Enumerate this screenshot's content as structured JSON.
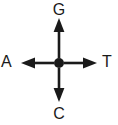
{
  "figure": {
    "type": "cross-arrow-diagram",
    "background_color": "#ffffff",
    "stroke_color": "#1a1a1a",
    "center": {
      "name": "center-node",
      "shape": "filled-circle",
      "x": 59,
      "y": 63,
      "radius": 5
    },
    "axes": [
      {
        "id": "top",
        "direction": "up",
        "label": "G",
        "arrow_tip": {
          "x": 59,
          "y": 18
        },
        "icon": "arrow-up-icon"
      },
      {
        "id": "right",
        "direction": "right",
        "label": "T",
        "arrow_tip": {
          "x": 97,
          "y": 63
        },
        "icon": "arrow-right-icon"
      },
      {
        "id": "bottom",
        "direction": "down",
        "label": "C",
        "arrow_tip": {
          "x": 59,
          "y": 102
        },
        "icon": "arrow-down-icon"
      },
      {
        "id": "left",
        "direction": "left",
        "label": "A",
        "arrow_tip": {
          "x": 21,
          "y": 63
        },
        "icon": "arrow-left-icon"
      }
    ]
  },
  "labels": {
    "top": "G",
    "right": "T",
    "bottom": "C",
    "left": "A"
  }
}
